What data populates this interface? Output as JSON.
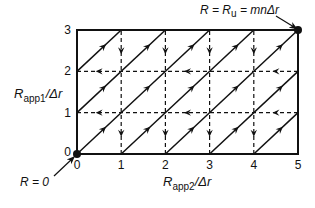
{
  "diagram": {
    "type": "lattice-path-diagram",
    "x_axis": {
      "label_main": "R",
      "label_sub": "app2",
      "label_suffix": "/Δr",
      "ticks": [
        "0",
        "1",
        "2",
        "3",
        "4",
        "5"
      ],
      "range": [
        0,
        5
      ]
    },
    "y_axis": {
      "label_main": "R",
      "label_sub": "app1",
      "label_suffix": "/Δr",
      "ticks": [
        "0",
        "1",
        "2",
        "3"
      ],
      "range": [
        0,
        3
      ]
    },
    "annotations": {
      "origin": {
        "text": "R = 0",
        "point": [
          0,
          0
        ]
      },
      "corner": {
        "text_pre": "R = R",
        "text_sub": "u",
        "text_post": " = mnΔr",
        "point": [
          5,
          3
        ]
      }
    },
    "solid_diagonals": [
      {
        "from": [
          0,
          2
        ],
        "to": [
          1,
          3
        ]
      },
      {
        "from": [
          0,
          1
        ],
        "to": [
          2,
          3
        ]
      },
      {
        "from": [
          0,
          0
        ],
        "to": [
          3,
          3
        ]
      },
      {
        "from": [
          1,
          0
        ],
        "to": [
          4,
          3
        ]
      },
      {
        "from": [
          2,
          0
        ],
        "to": [
          5,
          3
        ]
      },
      {
        "from": [
          3,
          0
        ],
        "to": [
          5,
          2
        ]
      },
      {
        "from": [
          4,
          0
        ],
        "to": [
          5,
          1
        ]
      }
    ],
    "dashed_vertical_x": [
      1,
      2,
      3,
      4
    ],
    "dashed_horizontal_y": [
      1,
      2
    ],
    "down_arrow_rows": [
      [
        2,
        3
      ],
      [
        0,
        1
      ]
    ],
    "left_arrow_cells": [
      [
        0,
        1
      ],
      [
        2,
        3
      ],
      [
        4,
        5
      ]
    ],
    "colors": {
      "line": "#111111",
      "background": "#ffffff"
    }
  }
}
